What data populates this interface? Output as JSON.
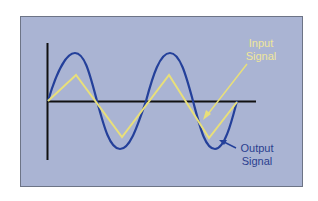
{
  "diagram": {
    "labels": {
      "input_line1": "Input",
      "input_line2": "Signal",
      "output_line1": "Output",
      "output_line2": "Signal"
    },
    "colors": {
      "background": "#aab4d3",
      "input": "#e8df7a",
      "output": "#24409a",
      "axis": "#111111"
    },
    "series": [
      {
        "name": "Input Signal",
        "shape": "triangle wave",
        "cycles": 2.25
      },
      {
        "name": "Output Signal",
        "shape": "sine wave",
        "cycles": 2.25
      }
    ]
  }
}
